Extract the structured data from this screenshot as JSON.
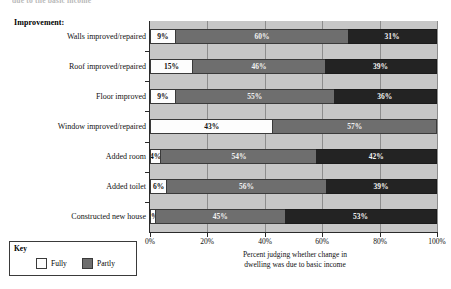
{
  "cut_off_text": "due to the basic income",
  "heading": "Improvement:",
  "axis": {
    "x_ticks": [
      "0%",
      "20%",
      "40%",
      "60%",
      "80%",
      "100%"
    ],
    "caption_line1": "Percent judging whether change in",
    "caption_line2": "dwelling was due to basic income"
  },
  "legend": {
    "title": "Key",
    "items": [
      {
        "label": "Fully",
        "color": "#fdfdfd"
      },
      {
        "label": "Partly",
        "color": "#6e6e6e"
      }
    ]
  },
  "chart_data": {
    "type": "bar",
    "orientation": "horizontal",
    "stacked": true,
    "title": "Improvement:",
    "xlabel": "Percent judging whether change in dwelling was due to basic income",
    "ylabel": "",
    "xlim": [
      0,
      100
    ],
    "grid": true,
    "legend_position": "bottom-left",
    "categories": [
      "Walls improved/repaired",
      "Roof improved/repaired",
      "Floor improved",
      "Window improved/repaired",
      "Added room",
      "Added toilet",
      "Constructed new house"
    ],
    "series": [
      {
        "name": "Fully",
        "color": "#fdfdfd",
        "values": [
          9,
          15,
          9,
          43,
          4,
          6,
          2
        ]
      },
      {
        "name": "Partly",
        "color": "#6e6e6e",
        "values": [
          60,
          46,
          55,
          57,
          54,
          56,
          45
        ]
      },
      {
        "name": "",
        "color": "#232323",
        "values": [
          31,
          39,
          36,
          0,
          42,
          39,
          53
        ]
      }
    ],
    "rows": [
      {
        "label": "Walls improved/repaired",
        "fully": "9%",
        "partly": "60%",
        "other": "31%"
      },
      {
        "label": "Roof improved/repaired",
        "fully": "15%",
        "partly": "46%",
        "other": "39%"
      },
      {
        "label": "Floor improved",
        "fully": "9%",
        "partly": "55%",
        "other": "36%"
      },
      {
        "label": "Window improved/repaired",
        "fully": "43%",
        "partly": "57%",
        "other": ""
      },
      {
        "label": "Added room",
        "fully": "4%",
        "partly": "54%",
        "other": "42%"
      },
      {
        "label": "Added toilet",
        "fully": "6%",
        "partly": "56%",
        "other": "39%"
      },
      {
        "label": "Constructed new house",
        "fully": "2%",
        "partly": "45%",
        "other": "53%"
      }
    ]
  }
}
